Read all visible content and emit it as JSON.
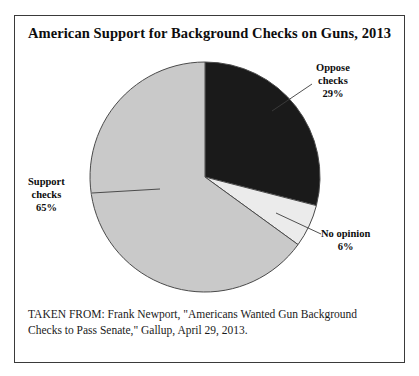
{
  "figure": {
    "title": "American Support for Background Checks on Guns, 2013",
    "source_caption": "TAKEN FROM: Frank Newport, \"Americans Wanted Gun Background Checks to Pass Senate,\" Gallup, April 29, 2013."
  },
  "labels": {
    "oppose": {
      "line1": "Oppose",
      "line2": "checks",
      "pct": "29%"
    },
    "support": {
      "line1": "Support",
      "line2": "checks",
      "pct": "65%"
    },
    "no_opinion": {
      "line1": "No opinion",
      "pct": "6%"
    }
  },
  "colors": {
    "oppose": "#1a1a1a",
    "support": "#c9c9c9",
    "no_opinion": "#ebebeb",
    "slice_outline": "#4a4a4a",
    "frame": "#3a3a3a",
    "text": "#0d0d0d"
  },
  "chart_data": {
    "type": "pie",
    "title": "American Support for Background Checks on Guns, 2013",
    "xlabel": "",
    "ylabel": "",
    "units": "percent",
    "start_angle_deg": 0,
    "direction": "clockwise",
    "legend_position": "callout-labels",
    "grid": false,
    "categories": [
      "Oppose checks",
      "No opinion",
      "Support checks"
    ],
    "values": [
      29,
      6,
      65
    ],
    "slices": [
      {
        "label": "Oppose checks",
        "value": 29,
        "display": "29%",
        "color": "#1a1a1a",
        "start_deg": 0,
        "end_deg": 104.4
      },
      {
        "label": "No opinion",
        "value": 6,
        "display": "6%",
        "color": "#ebebeb",
        "start_deg": 104.4,
        "end_deg": 126.0
      },
      {
        "label": "Support checks",
        "value": 65,
        "display": "65%",
        "color": "#c9c9c9",
        "start_deg": 126.0,
        "end_deg": 360.0
      }
    ],
    "total": 100,
    "annotations": [
      "TAKEN FROM: Frank Newport, \"Americans Wanted Gun Background Checks to Pass Senate,\" Gallup, April 29, 2013."
    ]
  }
}
